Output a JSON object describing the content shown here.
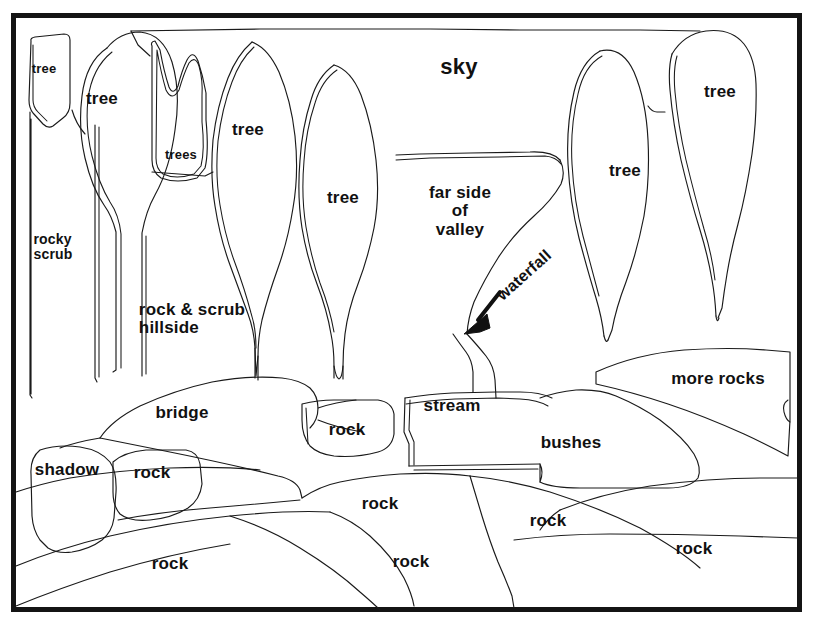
{
  "diagram": {
    "style": {
      "background_color": "#ffffff",
      "line_color": "#1a1a1a",
      "frame_color": "#141414",
      "text_color": "#111111"
    },
    "frame": {
      "x": 11,
      "y": 13,
      "width": 790,
      "height": 598
    },
    "labels": [
      {
        "id": "tree-1",
        "text": "tree",
        "x": 44,
        "y": 69,
        "size": 13,
        "rotated": false
      },
      {
        "id": "tree-2",
        "text": "tree",
        "x": 102,
        "y": 99,
        "size": 17,
        "rotated": false
      },
      {
        "id": "trees",
        "text": "trees",
        "x": 181,
        "y": 155,
        "size": 13,
        "rotated": false
      },
      {
        "id": "tree-3",
        "text": "tree",
        "x": 248,
        "y": 130,
        "size": 17,
        "rotated": false
      },
      {
        "id": "tree-4",
        "text": "tree",
        "x": 343,
        "y": 198,
        "size": 17,
        "rotated": false
      },
      {
        "id": "sky",
        "text": "sky",
        "x": 459,
        "y": 67,
        "size": 22,
        "rotated": false
      },
      {
        "id": "far-side",
        "text": "far side\nof\nvalley",
        "x": 460,
        "y": 212,
        "size": 17,
        "rotated": false
      },
      {
        "id": "tree-5",
        "text": "tree",
        "x": 625,
        "y": 171,
        "size": 17,
        "rotated": false
      },
      {
        "id": "tree-6",
        "text": "tree",
        "x": 720,
        "y": 92,
        "size": 17,
        "rotated": false
      },
      {
        "id": "rocky-scrub",
        "text": "rocky\nscrub",
        "x": 53,
        "y": 247,
        "size": 14,
        "rotated": false
      },
      {
        "id": "rock-scrub-hillside",
        "text": "rock & scrub\nhillside",
        "x": 192,
        "y": 319,
        "size": 17,
        "rotated": false
      },
      {
        "id": "waterfall",
        "text": "waterfall",
        "x": 524,
        "y": 275,
        "size": 16,
        "rotated": true
      },
      {
        "id": "bridge",
        "text": "bridge",
        "x": 182,
        "y": 413,
        "size": 17,
        "rotated": false
      },
      {
        "id": "rock-a",
        "text": "rock",
        "x": 347,
        "y": 430,
        "size": 17,
        "rotated": false
      },
      {
        "id": "stream",
        "text": "stream",
        "x": 452,
        "y": 406,
        "size": 17,
        "rotated": false
      },
      {
        "id": "bushes",
        "text": "bushes",
        "x": 571,
        "y": 443,
        "size": 17,
        "rotated": false
      },
      {
        "id": "more-rocks",
        "text": "more rocks",
        "x": 718,
        "y": 379,
        "size": 17,
        "rotated": false
      },
      {
        "id": "shadow",
        "text": "shadow",
        "x": 67,
        "y": 470,
        "size": 17,
        "rotated": false
      },
      {
        "id": "rock-b",
        "text": "rock",
        "x": 152,
        "y": 473,
        "size": 17,
        "rotated": false
      },
      {
        "id": "rock-c",
        "text": "rock",
        "x": 380,
        "y": 504,
        "size": 17,
        "rotated": false
      },
      {
        "id": "rock-d",
        "text": "rock",
        "x": 548,
        "y": 521,
        "size": 17,
        "rotated": false
      },
      {
        "id": "rock-e",
        "text": "rock",
        "x": 170,
        "y": 564,
        "size": 17,
        "rotated": false
      },
      {
        "id": "rock-f",
        "text": "rock",
        "x": 411,
        "y": 562,
        "size": 17,
        "rotated": false
      },
      {
        "id": "rock-g",
        "text": "rock",
        "x": 694,
        "y": 549,
        "size": 17,
        "rotated": false
      }
    ],
    "annotations": [
      {
        "id": "waterfall-arrow",
        "kind": "arrow",
        "from_x": 500,
        "from_y": 292,
        "to_x": 466,
        "to_y": 332
      }
    ]
  }
}
